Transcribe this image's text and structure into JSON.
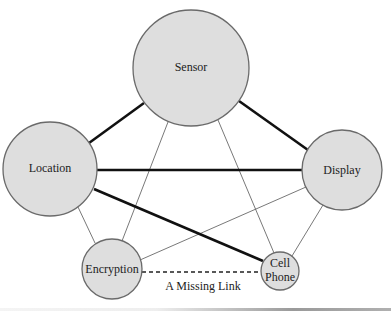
{
  "diagram": {
    "nodes": [
      {
        "id": "sensor",
        "label": "Sensor",
        "cx": 191,
        "cy": 68,
        "r": 58
      },
      {
        "id": "location",
        "label": "Location",
        "cx": 50,
        "cy": 169,
        "r": 47
      },
      {
        "id": "display",
        "label": "Display",
        "cx": 342,
        "cy": 170,
        "r": 40
      },
      {
        "id": "encryption",
        "label": "Encryption",
        "cx": 112,
        "cy": 269,
        "r": 30
      },
      {
        "id": "cellphone",
        "label_line1": "Cell",
        "label_line2": "Phone",
        "cx": 280,
        "cy": 271,
        "r": 19
      }
    ],
    "edges": [
      {
        "from": "sensor",
        "to": "location",
        "style": "thick"
      },
      {
        "from": "sensor",
        "to": "display",
        "style": "thick"
      },
      {
        "from": "location",
        "to": "display",
        "style": "thick"
      },
      {
        "from": "location",
        "to": "cellphone",
        "style": "thick"
      },
      {
        "from": "sensor",
        "to": "encryption",
        "style": "thin"
      },
      {
        "from": "sensor",
        "to": "cellphone",
        "style": "thin"
      },
      {
        "from": "location",
        "to": "encryption",
        "style": "thin"
      },
      {
        "from": "display",
        "to": "encryption",
        "style": "thin"
      },
      {
        "from": "display",
        "to": "cellphone",
        "style": "thin"
      },
      {
        "from": "encryption",
        "to": "cellphone",
        "style": "dashed",
        "caption": "A Missing Link"
      }
    ],
    "colors": {
      "node_fill": "#dedede",
      "node_stroke": "#6a6a6a",
      "thick_edge": "#111111",
      "thin_edge": "#555555"
    }
  }
}
